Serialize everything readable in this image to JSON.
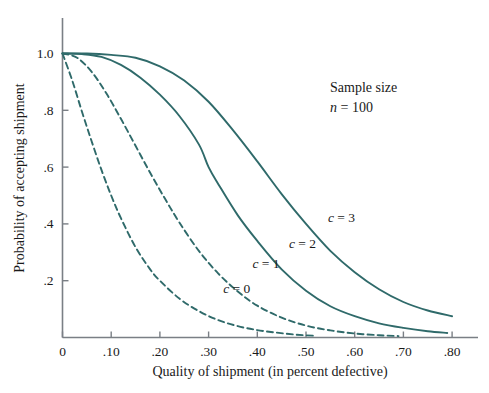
{
  "chart_data": {
    "type": "line",
    "title": "",
    "xlabel": "Quality of shipment (in percent defective)",
    "ylabel": "Probability of accepting shipment",
    "xlim": [
      0,
      0.84
    ],
    "ylim": [
      0,
      1.04
    ],
    "grid": false,
    "legend_position": "inline-curve-labels",
    "xticks": [
      0,
      0.1,
      0.2,
      0.3,
      0.4,
      0.5,
      0.6,
      0.7,
      0.8
    ],
    "xtick_labels": [
      "0",
      ".10",
      ".20",
      ".30",
      ".40",
      ".50",
      ".60",
      ".70",
      ".80"
    ],
    "yticks": [
      0.2,
      0.4,
      0.6,
      0.8,
      1.0
    ],
    "ytick_labels": [
      ".2",
      ".4",
      ".6",
      ".8",
      "1.0"
    ],
    "annotations": [
      {
        "name": "sample-size",
        "line1": "Sample size",
        "line2_italic": "n",
        "line2_rest": " = 100",
        "x": 0.55,
        "y": 0.9
      }
    ],
    "line_color": "#2f6a6a",
    "axis_color": "#7a7f85",
    "series": [
      {
        "name": "c = 0",
        "c": 0,
        "style": "dashed",
        "label": "c = 0",
        "label_italic": "c",
        "label_rest": " = 0",
        "label_x": 0.33,
        "label_y": 0.155,
        "x": [
          0.0,
          0.02,
          0.04,
          0.06,
          0.08,
          0.1,
          0.12,
          0.15,
          0.18,
          0.2,
          0.24,
          0.28,
          0.32,
          0.36,
          0.4,
          0.44,
          0.48,
          0.52
        ],
        "y": [
          1.0,
          0.905,
          0.795,
          0.69,
          0.59,
          0.5,
          0.42,
          0.318,
          0.24,
          0.2,
          0.137,
          0.093,
          0.061,
          0.04,
          0.026,
          0.017,
          0.01,
          0.006
        ]
      },
      {
        "name": "c = 1",
        "c": 1,
        "style": "dashed",
        "label": "c = 1",
        "label_italic": "c",
        "label_rest": " = 1",
        "label_x": 0.39,
        "label_y": 0.245,
        "x": [
          0.0,
          0.03,
          0.06,
          0.09,
          0.12,
          0.15,
          0.18,
          0.21,
          0.24,
          0.28,
          0.32,
          0.36,
          0.4,
          0.45,
          0.5,
          0.55,
          0.6,
          0.65,
          0.69
        ],
        "y": [
          1.0,
          0.985,
          0.935,
          0.86,
          0.77,
          0.675,
          0.58,
          0.49,
          0.405,
          0.305,
          0.225,
          0.162,
          0.112,
          0.07,
          0.042,
          0.025,
          0.014,
          0.008,
          0.005
        ]
      },
      {
        "name": "c = 2",
        "c": 2,
        "style": "solid",
        "label": "c = 2",
        "label_italic": "c",
        "label_rest": " = 2",
        "label_x": 0.465,
        "label_y": 0.315,
        "x": [
          0.0,
          0.04,
          0.08,
          0.12,
          0.16,
          0.2,
          0.24,
          0.28,
          0.3,
          0.32,
          0.36,
          0.4,
          0.45,
          0.5,
          0.55,
          0.6,
          0.65,
          0.7,
          0.75,
          0.79
        ],
        "y": [
          1.0,
          0.998,
          0.988,
          0.96,
          0.915,
          0.855,
          0.78,
          0.68,
          0.6,
          0.54,
          0.43,
          0.34,
          0.24,
          0.165,
          0.11,
          0.075,
          0.05,
          0.034,
          0.022,
          0.016
        ]
      },
      {
        "name": "c = 3",
        "c": 3,
        "style": "solid",
        "label": "c = 3",
        "label_italic": "c",
        "label_rest": " = 3",
        "label_x": 0.545,
        "label_y": 0.405,
        "x": [
          0.0,
          0.05,
          0.1,
          0.15,
          0.2,
          0.25,
          0.3,
          0.35,
          0.4,
          0.45,
          0.5,
          0.55,
          0.6,
          0.65,
          0.7,
          0.75,
          0.8
        ],
        "y": [
          1.0,
          1.0,
          0.995,
          0.985,
          0.955,
          0.905,
          0.83,
          0.73,
          0.62,
          0.505,
          0.4,
          0.305,
          0.23,
          0.17,
          0.125,
          0.095,
          0.075
        ]
      }
    ]
  },
  "axes": {
    "x_axis_label": "Quality of shipment (in percent defective)",
    "y_axis_label": "Probability of accepting shipment"
  },
  "annotation": {
    "sample_size_label": "Sample size",
    "n_symbol": "n",
    "n_value": " = 100"
  }
}
